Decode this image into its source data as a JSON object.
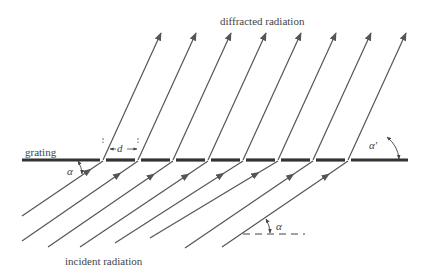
{
  "labels": {
    "diffracted": "diffracted radiation",
    "incident": "incident radiation",
    "grating": "grating",
    "spacing": "d",
    "incident_angle": "α",
    "incident_angle_ref": "α",
    "diffracted_angle": "α′"
  },
  "colors": {
    "ray": "#555555",
    "grating": "#333333",
    "text": "#444444"
  },
  "geometry": {
    "grating_y": 160,
    "grating_x_start": 22,
    "grating_x_end": 408,
    "slit_x": [
      103,
      138,
      173,
      208,
      243,
      278,
      313,
      348
    ],
    "diffracted_tip_y": 33,
    "diffracted_dx": 58,
    "incident_start": [
      [
        22,
        216
      ],
      [
        22,
        241
      ],
      [
        48,
        247
      ],
      [
        80,
        247
      ],
      [
        115,
        243
      ],
      [
        150,
        238
      ],
      [
        185,
        248
      ],
      [
        222,
        247
      ]
    ]
  }
}
